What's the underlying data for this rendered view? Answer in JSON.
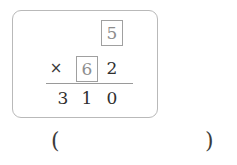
{
  "problem": {
    "type": "vertical-multiplication",
    "carry_box": {
      "value": "5",
      "filled": true,
      "column": "ones"
    },
    "operator": "×",
    "multiplier": {
      "tens_box": {
        "value": "6",
        "filled": true
      },
      "ones_digit": "2"
    },
    "product": {
      "hundreds": "3",
      "tens": "1",
      "ones": "0",
      "full": "310"
    }
  },
  "answer_blank": {
    "open_paren": "(",
    "close_paren": ")",
    "value": ""
  },
  "colors": {
    "card_border": "#b9b9b9",
    "box_border": "#a0a0a0",
    "boxed_digit_text": "#8d8d8d",
    "digit_text": "#2f2f2f",
    "rule_line": "#9a9a9a",
    "background": "#ffffff"
  }
}
